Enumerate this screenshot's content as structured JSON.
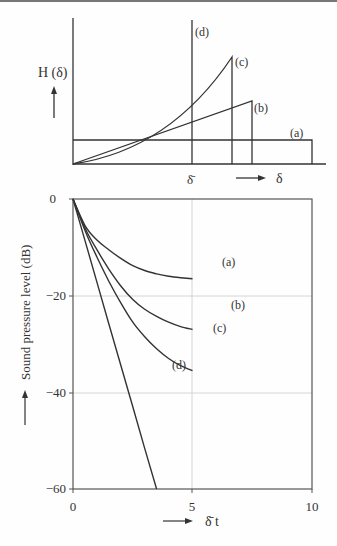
{
  "chart_data": [
    {
      "type": "line",
      "title": "",
      "ylabel": "H (δ)",
      "xlabel": "δ",
      "x_tick_labels": [
        "δ̄"
      ],
      "description": "Distributions H(δ) of decay constants",
      "series": [
        {
          "name": "(a)",
          "shape": "uniform rectangle",
          "points": [
            [
              0,
              0.2
            ],
            [
              1.3,
              0.2
            ],
            [
              1.3,
              0
            ]
          ]
        },
        {
          "name": "(b)",
          "shape": "linear ramp",
          "points": [
            [
              0,
              0
            ],
            [
              0.95,
              0.47
            ],
            [
              0.95,
              0
            ]
          ]
        },
        {
          "name": "(c)",
          "shape": "quadratic ramp",
          "points": [
            [
              0,
              0
            ],
            [
              0.3,
              0.08
            ],
            [
              0.6,
              0.3
            ],
            [
              0.85,
              0.65
            ],
            [
              0.85,
              0
            ]
          ]
        },
        {
          "name": "(d)",
          "shape": "delta at mean",
          "points": [
            [
              0.64,
              0
            ],
            [
              0.64,
              1.0
            ]
          ]
        }
      ],
      "labels": {
        "a": "(a)",
        "b": "(b)",
        "c": "(c)",
        "d": "(d)",
        "mean": "δ̄",
        "arrow_x": "δ",
        "y": "H (δ)"
      }
    },
    {
      "type": "line",
      "title": "",
      "xlabel": "δ̄ t",
      "ylabel": "Sound pressure level (dB)",
      "xlim": [
        0,
        10
      ],
      "ylim": [
        -60,
        0
      ],
      "x_ticks": [
        0,
        5,
        10
      ],
      "y_ticks": [
        0,
        -20,
        -40,
        -60
      ],
      "x_tick_labels": [
        "0",
        "5",
        "10"
      ],
      "y_tick_labels": [
        "0",
        "−20",
        "−40",
        "−60"
      ],
      "grid": true,
      "x": [
        0,
        1,
        2,
        3,
        4,
        5,
        6,
        7,
        8,
        9,
        10
      ],
      "series": [
        {
          "name": "(a)",
          "values": [
            0,
            -5.5,
            -8.5,
            -10.5,
            -12.3,
            -13.8,
            -14.8,
            -15.5,
            -16,
            -16.3,
            -16.5
          ]
        },
        {
          "name": "(b)",
          "values": [
            0,
            -6,
            -10.5,
            -14.5,
            -18,
            -20.8,
            -22.8,
            -24.3,
            -25.5,
            -26.4,
            -27
          ]
        },
        {
          "name": "(c)",
          "values": [
            0,
            -6.5,
            -12,
            -17,
            -21.5,
            -25.5,
            -28.5,
            -31,
            -33,
            -34.5,
            -35.5
          ]
        },
        {
          "name": "(d)",
          "values": [
            0,
            -8.6,
            -17.2,
            -25.8,
            -34.4,
            -43,
            -51.6,
            -60
          ]
        }
      ]
    }
  ],
  "top": {
    "y_label": "H (δ)",
    "mean_label": "δ̄",
    "x_label": "δ",
    "a": "(a)",
    "b": "(b)",
    "c": "(c)",
    "d": "(d)"
  },
  "bottom": {
    "y_label": "Sound pressure level (dB)",
    "x_label": "δ̄ t",
    "yticks": [
      "0",
      "−20",
      "−40",
      "−60"
    ],
    "xticks": [
      "0",
      "5",
      "10"
    ],
    "a": "(a)",
    "b": "(b)",
    "c": "(c)",
    "d": "(d)"
  }
}
